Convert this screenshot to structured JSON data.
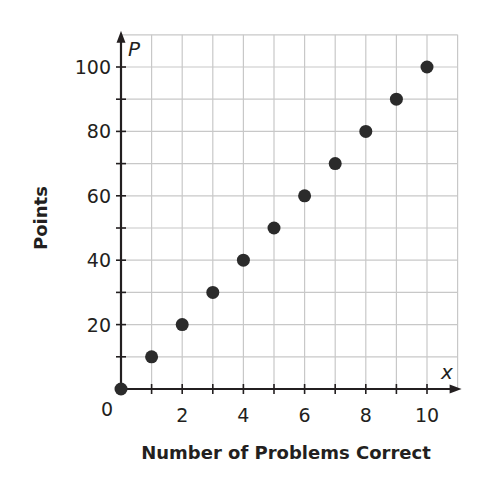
{
  "chart_data": {
    "type": "scatter",
    "title": "",
    "xlabel": "Number of Problems Correct",
    "ylabel": "Points",
    "x_var": "x",
    "y_var": "P",
    "xlim": [
      0,
      11
    ],
    "ylim": [
      0,
      110
    ],
    "x_ticks": [
      0,
      2,
      4,
      6,
      8,
      10
    ],
    "y_ticks": [
      20,
      40,
      60,
      80,
      100
    ],
    "origin_label": "0",
    "grid": true,
    "legend": null,
    "series": [
      {
        "name": "Points",
        "x": [
          0,
          1,
          2,
          3,
          4,
          5,
          6,
          7,
          8,
          9,
          10
        ],
        "values": [
          0,
          10,
          20,
          30,
          40,
          50,
          60,
          70,
          80,
          90,
          100
        ]
      }
    ]
  },
  "style": {
    "grid_color": "#c8c8c8",
    "axis_color": "#231f20",
    "point_color": "#2b2b2b"
  }
}
